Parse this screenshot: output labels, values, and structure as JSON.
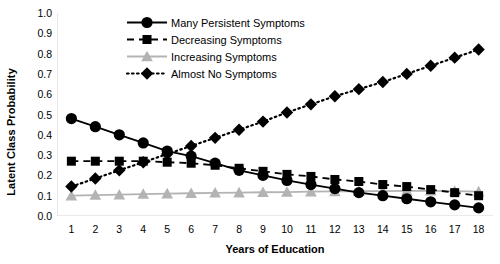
{
  "chart_data": {
    "type": "line",
    "title": "",
    "xlabel": "Years of Education",
    "ylabel": "Latent Class Probability",
    "x": [
      1,
      2,
      3,
      4,
      5,
      6,
      7,
      8,
      9,
      10,
      11,
      12,
      13,
      14,
      15,
      16,
      17,
      18
    ],
    "categories": [
      "1",
      "2",
      "3",
      "4",
      "5",
      "6",
      "7",
      "8",
      "9",
      "10",
      "11",
      "12",
      "13",
      "14",
      "15",
      "16",
      "17",
      "18"
    ],
    "xlim": [
      0.4,
      18.6
    ],
    "ylim": [
      0.0,
      1.0
    ],
    "ytick_labels": [
      "0.0",
      "0.1",
      "0.2",
      "0.3",
      "0.4",
      "0.5",
      "0.6",
      "0.7",
      "0.8",
      "0.9",
      "1.0"
    ],
    "ytick_values": [
      0.0,
      0.1,
      0.2,
      0.3,
      0.4,
      0.5,
      0.6,
      0.7,
      0.8,
      0.9,
      1.0
    ],
    "grid": false,
    "legend_position": "top-center-inside",
    "series": [
      {
        "name": "Many Persistent Symptoms",
        "marker": "circle",
        "linestyle": "solid",
        "color": "#000000",
        "values": [
          0.48,
          0.44,
          0.4,
          0.36,
          0.32,
          0.295,
          0.26,
          0.225,
          0.2,
          0.175,
          0.155,
          0.135,
          0.115,
          0.1,
          0.085,
          0.07,
          0.055,
          0.04
        ]
      },
      {
        "name": "Decreasing Symptoms",
        "marker": "square",
        "linestyle": "dashed",
        "color": "#000000",
        "values": [
          0.27,
          0.27,
          0.27,
          0.27,
          0.265,
          0.26,
          0.25,
          0.235,
          0.22,
          0.205,
          0.195,
          0.18,
          0.17,
          0.155,
          0.145,
          0.13,
          0.115,
          0.1
        ]
      },
      {
        "name": "Increasing Symptoms",
        "marker": "triangle",
        "linestyle": "solid",
        "color": "#b3b3b3",
        "values": [
          0.1,
          0.103,
          0.105,
          0.108,
          0.11,
          0.112,
          0.114,
          0.115,
          0.117,
          0.118,
          0.12,
          0.121,
          0.122,
          0.123,
          0.124,
          0.124,
          0.123,
          0.12
        ]
      },
      {
        "name": "Almost No Symptoms",
        "marker": "diamond",
        "linestyle": "dotted",
        "color": "#000000",
        "values": [
          0.145,
          0.185,
          0.225,
          0.265,
          0.305,
          0.345,
          0.385,
          0.425,
          0.465,
          0.51,
          0.55,
          0.59,
          0.625,
          0.66,
          0.7,
          0.74,
          0.78,
          0.82
        ]
      }
    ]
  },
  "legend": {
    "items": [
      {
        "label": "Many Persistent Symptoms"
      },
      {
        "label": "Decreasing Symptoms"
      },
      {
        "label": "Increasing Symptoms"
      },
      {
        "label": "Almost No Symptoms"
      }
    ]
  },
  "axes": {
    "x_title": "Years of Education",
    "y_title": "Latent Class Probability"
  }
}
